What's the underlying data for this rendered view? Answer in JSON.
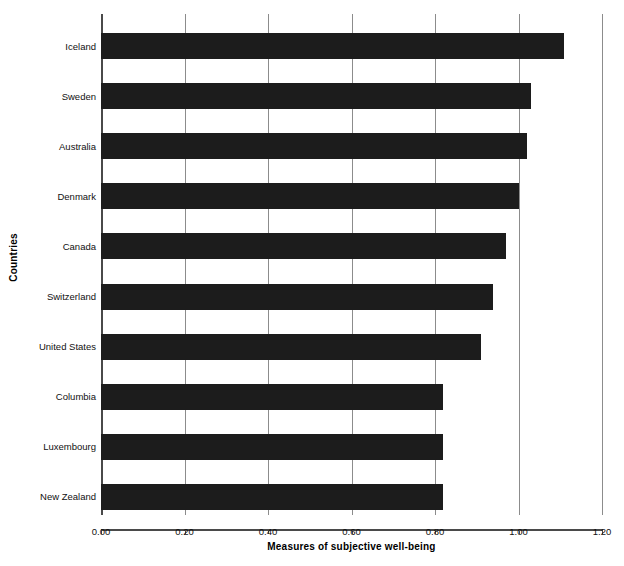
{
  "chart_data": {
    "type": "bar",
    "orientation": "horizontal",
    "title": "",
    "xlabel": "Measures of subjective well-being",
    "ylabel": "Countries",
    "categories": [
      "Iceland",
      "Sweden",
      "Australia",
      "Denmark",
      "Canada",
      "Switzerland",
      "United States",
      "Columbia",
      "Luxembourg",
      "New Zealand"
    ],
    "values": [
      1.11,
      1.03,
      1.02,
      1.0,
      0.97,
      0.94,
      0.91,
      0.82,
      0.82,
      0.82
    ],
    "xlim": [
      0.0,
      1.2
    ],
    "xticks": [
      0.0,
      0.2,
      0.4,
      0.6,
      0.8,
      1.0,
      1.2
    ],
    "xtick_labels": [
      "0.00",
      "0.20",
      "0.40",
      "0.60",
      "0.80",
      "1.00",
      "1.20"
    ],
    "grid": "vertical",
    "legend": "none",
    "bar_color": "#1c1c1c",
    "grid_color": "#8c8c8c",
    "axis_color": "#4a4a4a",
    "background_color": "#ffffff"
  }
}
